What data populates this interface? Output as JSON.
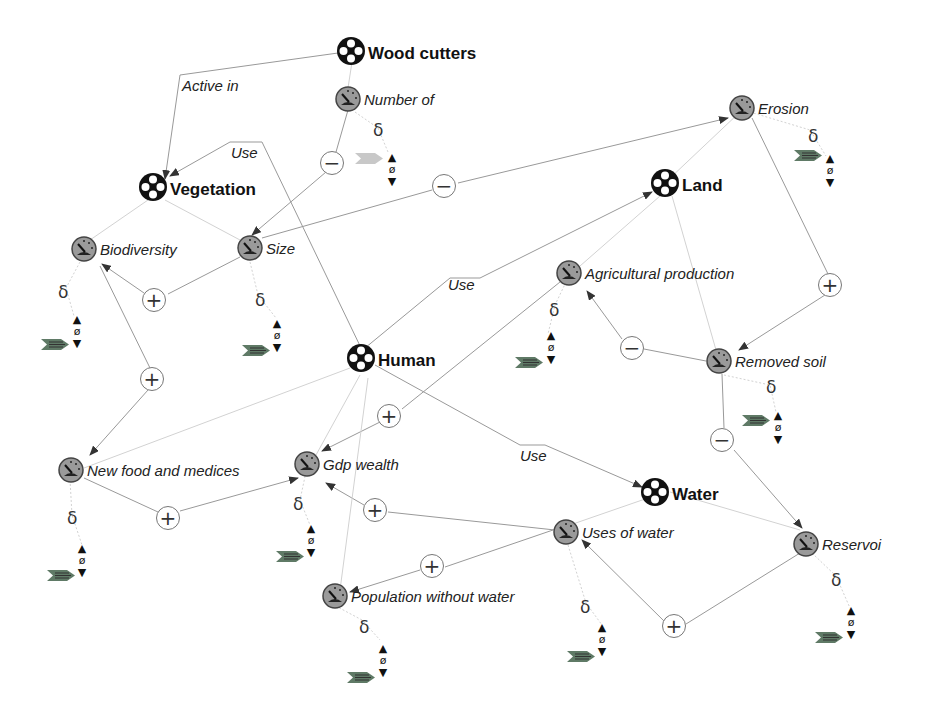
{
  "diagram": {
    "entities": [
      {
        "id": "wood-cutters",
        "label": "Wood cutters"
      },
      {
        "id": "vegetation",
        "label": "Vegetation"
      },
      {
        "id": "land",
        "label": "Land"
      },
      {
        "id": "human",
        "label": "Human"
      },
      {
        "id": "water",
        "label": "Water"
      }
    ],
    "quantities": [
      {
        "id": "number-of",
        "label": "Number of",
        "entity": "Wood cutters"
      },
      {
        "id": "erosion",
        "label": "Erosion",
        "entity": "Land"
      },
      {
        "id": "biodiversity",
        "label": "Biodiversity",
        "entity": "Vegetation"
      },
      {
        "id": "size",
        "label": "Size",
        "entity": "Vegetation"
      },
      {
        "id": "agricultural-production",
        "label": "Agricultural production",
        "entity": "Land"
      },
      {
        "id": "removed-soil",
        "label": "Removed soil",
        "entity": "Land"
      },
      {
        "id": "new-food-and-medices",
        "label": "New food and medices",
        "entity": "Vegetation"
      },
      {
        "id": "gdp-wealth",
        "label": "Gdp wealth",
        "entity": "Human"
      },
      {
        "id": "uses-of-water",
        "label": "Uses of water",
        "entity": "Water"
      },
      {
        "id": "reservoir",
        "label": "Reservoi",
        "entity": "Water"
      },
      {
        "id": "population-without-water",
        "label": "Population without water",
        "entity": "Human"
      }
    ],
    "relations": [
      {
        "from": "Wood cutters",
        "to": "Vegetation",
        "label": "Active in"
      },
      {
        "from": "Human",
        "to": "Vegetation",
        "label": "Use"
      },
      {
        "from": "Human",
        "to": "Land",
        "label": "Use"
      },
      {
        "from": "Human",
        "to": "Water",
        "label": "Use"
      }
    ],
    "influences": [
      {
        "from": "Number of",
        "to": "Size",
        "sign": "−"
      },
      {
        "from": "Size",
        "to": "Erosion",
        "sign": "−"
      },
      {
        "from": "Size",
        "to": "Biodiversity",
        "sign": "+"
      },
      {
        "from": "Biodiversity",
        "to": "New food and medices",
        "sign": "+"
      },
      {
        "from": "New food and medices",
        "to": "Gdp wealth",
        "sign": "+"
      },
      {
        "from": "Agricultural production",
        "to": "Gdp wealth",
        "sign": "+"
      },
      {
        "from": "Uses of water",
        "to": "Gdp wealth",
        "sign": "+"
      },
      {
        "from": "Uses of water",
        "to": "Population without water",
        "sign": "+"
      },
      {
        "from": "Reservoir",
        "to": "Uses of water",
        "sign": "+"
      },
      {
        "from": "Removed soil",
        "to": "Agricultural production",
        "sign": "−"
      },
      {
        "from": "Erosion",
        "to": "Removed soil",
        "sign": "+"
      },
      {
        "from": "Removed soil",
        "to": "Reservoir",
        "sign": "−"
      }
    ],
    "symbols": {
      "delta": "δ",
      "zero": "ø",
      "up": "▲",
      "down": "▼",
      "plus": "+",
      "minus": "−"
    },
    "colors": {
      "edge": "#888888",
      "edge_light": "#c8c8c8",
      "entity_icon": "#111111",
      "quantity_icon_fill": "#9a9a9a",
      "derivative_arrow": "#6f8a6f"
    }
  }
}
